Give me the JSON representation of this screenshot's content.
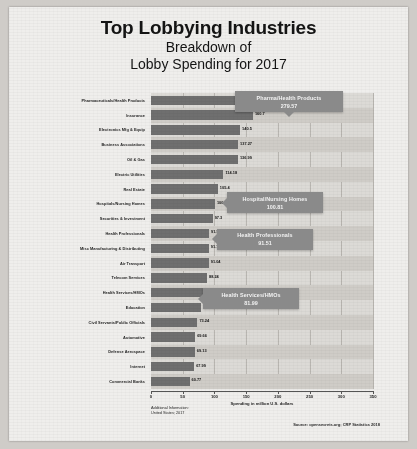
{
  "header": {
    "title": "Top Lobbying Industries",
    "subtitle_line1": "Breakdown of",
    "subtitle_line2": "Lobby Spending for 2017"
  },
  "footer": {
    "additional_info_label": "Additional Information:",
    "additional_info_value": "United States; 2017",
    "source": "Source: opensecrets.org; CRP Statistics 2018"
  },
  "callouts": [
    {
      "name": "Pharma/Health Products",
      "value": "279.57"
    },
    {
      "name": "Hospital/Nursing Homes",
      "value": "100.81"
    },
    {
      "name": "Health Professionals",
      "value": "91.51"
    },
    {
      "name": "Health Services/HMOs",
      "value": "81.99"
    }
  ],
  "chart_data": {
    "type": "bar",
    "orientation": "horizontal",
    "title": "Top Lobbying Industries",
    "subtitle": "Breakdown of Lobby Spending for 2017",
    "xlabel": "Spending in million U.S. dollars",
    "ylabel": "",
    "xlim": [
      0,
      350
    ],
    "xticks": [
      0,
      50,
      100,
      150,
      200,
      250,
      300,
      350
    ],
    "grid": true,
    "legend": "none",
    "bar_color": "#6f6f6f",
    "callout_color": "#8a8a8a",
    "categories": [
      "Pharmaceuticals/Health Products",
      "Insurance",
      "Electronics Mfg & Equip",
      "Business Associations",
      "Oil & Gas",
      "Electric Utilities",
      "Real Estate",
      "Hospitals/Nursing Homes",
      "Securities & Investment",
      "Health Professionals",
      "Misc Manufacturing & Distributing",
      "Air Transport",
      "Telecom Services",
      "Health Services/HMOs",
      "Education",
      "Civil Servants/Public Officials",
      "Automotive",
      "Defense Aerospace",
      "Internet",
      "Commercial Banks"
    ],
    "values": [
      279.57,
      160.7,
      140.5,
      137.27,
      136.99,
      114.18,
      105.4,
      100.81,
      97.3,
      91.51,
      91.18,
      91.04,
      88.24,
      81.99,
      79.6,
      73.24,
      69.66,
      69.13,
      67.99,
      60.77
    ],
    "value_labels": [
      "279.57",
      "160.7",
      "140.5",
      "137.27",
      "136.99",
      "114.18",
      "105.4",
      "100.81",
      "97.3",
      "91.51",
      "91.18",
      "91.04",
      "88.24",
      "81.99",
      "79.60",
      "73.24",
      "69.66",
      "69.13",
      "67.99",
      "60.77"
    ]
  }
}
